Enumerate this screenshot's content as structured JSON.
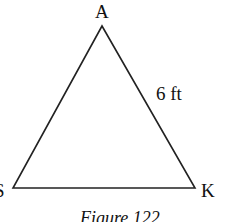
{
  "figure": {
    "caption": "Figure 122",
    "shape": "triangle",
    "vertices": [
      {
        "name": "A",
        "position": "top"
      },
      {
        "name": "S",
        "position": "bottom-left"
      },
      {
        "name": "K",
        "position": "bottom-right"
      }
    ],
    "side_labels": [
      {
        "side": "AK",
        "label": "6 ft"
      }
    ],
    "stroke_color": "#222222",
    "background_color": "#ffffff"
  }
}
